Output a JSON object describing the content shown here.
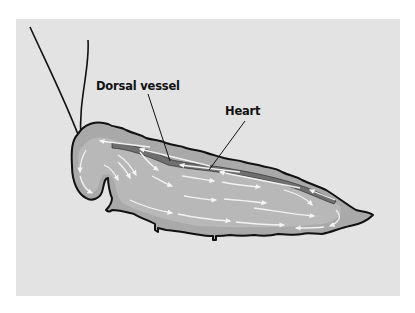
{
  "diagram": {
    "labels": {
      "dorsal_vessel": "Dorsal vessel",
      "heart": "Heart"
    },
    "colors": {
      "page_background": "#ffffff",
      "panel_background": "#e3e3e3",
      "body_outer_fill": "#a9a9a9",
      "body_inner_fill": "#b8b8b8",
      "vessel_fill": "#6f6f6f",
      "flow_arrows": "#f2f2f2",
      "outline": "#111111"
    },
    "flow": {
      "dorsal_direction": "posterior-to-anterior (toward head)",
      "body_cavity_direction": "anterior-to-posterior (toward tail)"
    }
  }
}
